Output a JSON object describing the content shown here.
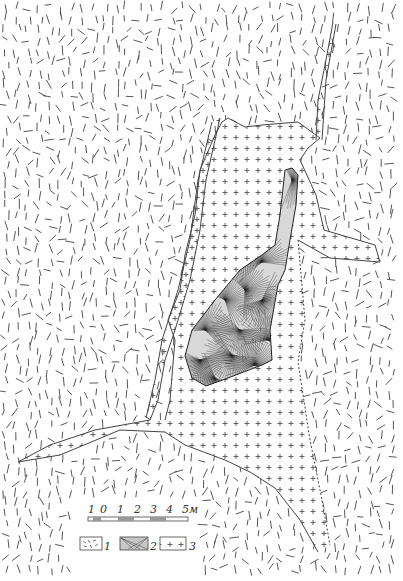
{
  "figure": {
    "type": "geological-map",
    "background": "#ffffff",
    "ink_color": "#333333"
  },
  "scale_bar": {
    "ticks": [
      "1",
      "0",
      "1",
      "2",
      "3",
      "4",
      "5"
    ],
    "unit": "м",
    "last_label": "5м"
  },
  "legend": {
    "items": [
      {
        "number": "1",
        "pattern": "dashes",
        "description_visible": false
      },
      {
        "number": "2",
        "pattern": "radiating-fans",
        "description_visible": false
      },
      {
        "number": "3",
        "pattern": "crosses",
        "description_visible": false
      }
    ]
  },
  "units": {
    "host_rock": {
      "legend_ref": "1",
      "pattern": "dashes"
    },
    "radial_body": {
      "legend_ref": "2",
      "pattern": "radiating-fans"
    },
    "cross_body": {
      "legend_ref": "3",
      "pattern": "crosses"
    }
  }
}
